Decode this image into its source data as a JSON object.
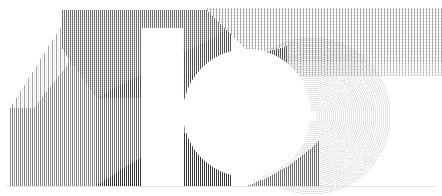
{
  "artwork": {
    "title": "Generative Hatched Numeral Composition",
    "alt_text": "Abstract black-and-white line-hatched geometric composition resembling the numerals 1 and 6",
    "canvas": {
      "width": 442,
      "height": 196,
      "background": "#ffffff"
    },
    "palette": {
      "background": "#ffffff",
      "ink": "#000000",
      "hatch_light": "#b9b9b9",
      "hatch_mid": "#8a8a8a",
      "hatch_dark": "#4a4a4a",
      "hatch_darkest": "#1a1a1a",
      "baseline": "#e2e2e2"
    },
    "technique": "fine vertical line hatching and concentric arc hatching",
    "shapes": [
      {
        "name": "left-striped-panel",
        "kind": "polygon",
        "label": "Left sparse vertical stripe block",
        "density": "sparse",
        "tone": "light"
      },
      {
        "name": "upper-hatched-slab",
        "kind": "polygon",
        "label": "Upper crosshatched slab with bevelled left edge",
        "density": "dense",
        "tone": "mid"
      },
      {
        "name": "numeral-one-stem",
        "kind": "negative-space",
        "label": "White vertical stem of numeral one",
        "density": "none",
        "tone": "white"
      },
      {
        "name": "numeral-one-flag",
        "kind": "polygon",
        "label": "Diagonal flag of numeral one",
        "density": "dense",
        "tone": "dark"
      },
      {
        "name": "diagonal-band",
        "kind": "parallelogram",
        "label": "Upper-right diagonal hatched band",
        "density": "medium",
        "tone": "light"
      },
      {
        "name": "chevron-wedge",
        "kind": "triangle",
        "label": "Dark chevron wedge pointing left",
        "density": "dense",
        "tone": "darkest"
      },
      {
        "name": "concentric-disc",
        "kind": "arc-stack",
        "label": "Concentric arc disc forming numeral six bowl",
        "density": "medium",
        "tone": "light",
        "arc_count": 74
      },
      {
        "name": "white-circle",
        "kind": "circle",
        "label": "Large white counter circle",
        "density": "none",
        "tone": "white",
        "center": [
          247,
          113
        ],
        "radius": 64
      },
      {
        "name": "baseline-rule",
        "kind": "line",
        "label": "Faint horizontal baseline rule",
        "density": "single",
        "tone": "very-light"
      }
    ],
    "hatch_fields": [
      {
        "name": "field-left",
        "spacing_px": 4,
        "stroke_width": 1.0,
        "opacity": 0.34
      },
      {
        "name": "field-mid",
        "spacing_px": 2,
        "stroke_width": 1.0,
        "opacity": 0.62
      },
      {
        "name": "field-upper",
        "spacing_px": 2,
        "stroke_width": 1.0,
        "opacity": 0.55
      },
      {
        "name": "field-dark",
        "spacing_px": 2,
        "stroke_width": 1.2,
        "opacity": 0.86
      },
      {
        "name": "field-band",
        "spacing_px": 3,
        "stroke_width": 1.0,
        "opacity": 0.3
      },
      {
        "name": "field-arcs",
        "spacing_px": 2,
        "stroke_width": 0.8,
        "opacity": 0.3
      }
    ]
  }
}
